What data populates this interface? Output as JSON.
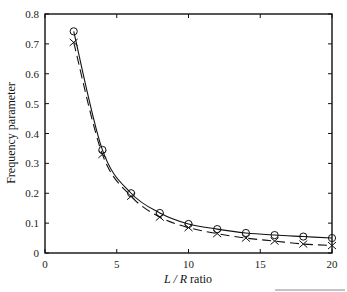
{
  "chart_data": {
    "type": "line",
    "title": "",
    "xlabel": "L / R ratio",
    "xlabel_parts": {
      "italic": "L / R",
      "plain": " ratio"
    },
    "ylabel": "Frequency parameter",
    "xlim": [
      0,
      20
    ],
    "ylim": [
      0,
      0.8
    ],
    "xticks": [
      0,
      5,
      10,
      15,
      20
    ],
    "yticks": [
      0,
      0.1,
      0.2,
      0.3,
      0.4,
      0.5,
      0.6,
      0.7,
      0.8
    ],
    "ytick_labels": [
      "0",
      "0.1",
      "0.2",
      "0.3",
      "0.4",
      "0.5",
      "0.6",
      "0.7",
      "0.8"
    ],
    "grid": false,
    "legend": null,
    "x": [
      2,
      4,
      6,
      8,
      10,
      12,
      14,
      16,
      18,
      20
    ],
    "series": [
      {
        "name": "solid-circle",
        "line_style": "solid",
        "marker": "circle",
        "values": [
          0.742,
          0.345,
          0.2,
          0.134,
          0.097,
          0.08,
          0.067,
          0.06,
          0.055,
          0.05
        ]
      },
      {
        "name": "dashed-cross",
        "line_style": "dashed",
        "marker": "x",
        "values": [
          0.705,
          0.33,
          0.19,
          0.12,
          0.085,
          0.065,
          0.05,
          0.04,
          0.03,
          0.025
        ]
      }
    ]
  },
  "colors": {
    "line": "#111111",
    "axis": "#111111"
  }
}
